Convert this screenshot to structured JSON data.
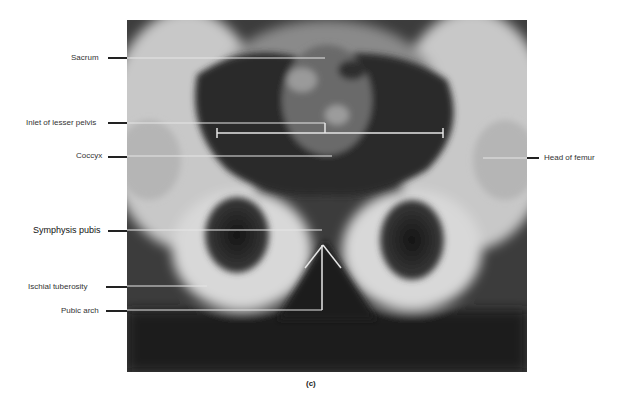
{
  "figure": {
    "caption": "(c)",
    "image_description": "Anteroposterior radiograph of the pelvis",
    "labels_left": [
      {
        "id": "sacrum",
        "text": "Sacrum"
      },
      {
        "id": "inlet",
        "text": "Inlet of lesser pelvis"
      },
      {
        "id": "coccyx",
        "text": "Coccyx"
      },
      {
        "id": "symphysis",
        "text": "Symphysis pubis"
      },
      {
        "id": "ischial",
        "text": "Ischial  tuberosity"
      },
      {
        "id": "pubic-arch",
        "text": "Pubic arch"
      }
    ],
    "labels_right": [
      {
        "id": "femur-head",
        "text": "Head of femur"
      }
    ]
  }
}
